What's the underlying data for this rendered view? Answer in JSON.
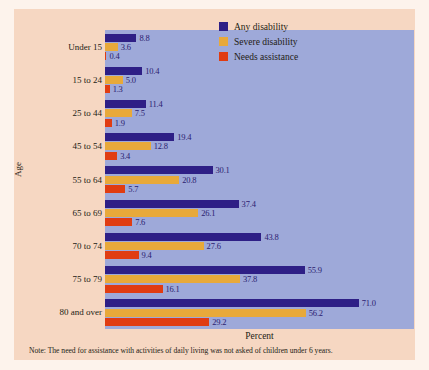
{
  "chart_data": {
    "type": "bar",
    "orientation": "horizontal",
    "title": "",
    "xlabel": "Percent",
    "ylabel": "Age",
    "categories": [
      "Under 15",
      "15 to 24",
      "25 to 44",
      "45 to 54",
      "55 to 64",
      "65 to 69",
      "70 to 74",
      "75 to 79",
      "80 and over"
    ],
    "series": [
      {
        "name": "Any disability",
        "color": "#2e1f86",
        "values": [
          8.8,
          10.4,
          11.4,
          19.4,
          30.1,
          37.4,
          43.8,
          55.9,
          71.0
        ],
        "labels": [
          "8.8",
          "10.4",
          "11.4",
          "19.4",
          "30.1",
          "37.4",
          "43.8",
          "55.9",
          "71.0"
        ]
      },
      {
        "name": "Severe disability",
        "color": "#e8a93a",
        "values": [
          3.6,
          5.0,
          7.5,
          12.8,
          20.8,
          26.1,
          27.6,
          37.8,
          56.2
        ],
        "labels": [
          "3.6",
          "5.0",
          "7.5",
          "12.8",
          "20.8",
          "26.1",
          "27.6",
          "37.8",
          "56.2"
        ]
      },
      {
        "name": "Needs assistance",
        "color": "#e03c12",
        "values": [
          0.4,
          1.3,
          1.9,
          3.4,
          5.7,
          7.6,
          9.4,
          16.1,
          29.2
        ],
        "labels": [
          "0.4",
          "1.3",
          "1.9",
          "3.4",
          "5.7",
          "7.6",
          "9.4",
          "16.1",
          "29.2"
        ]
      }
    ],
    "xlim": [
      0,
      80
    ],
    "grid": false,
    "legend_position": "top-right",
    "annotations": [
      "Note: The need for assistance with activities of daily living was not asked of children under 6 years."
    ]
  },
  "note": "Note: The need for assistance with activities of daily living was not asked of children under 6 years.",
  "colors": {
    "panel": "#9ea9d9",
    "card": "#f6d7c2",
    "any_disability": "#2e1f86",
    "severe_disability": "#e8a93a",
    "needs_assistance": "#e03c12",
    "value_label": "#2b2170"
  }
}
